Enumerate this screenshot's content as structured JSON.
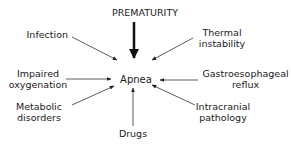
{
  "diagram": {
    "center": "Apnea",
    "top": "PREMATURITY",
    "causes": {
      "infection": "Infection",
      "impaired_oxygenation_1": "Impaired",
      "impaired_oxygenation_2": "oxygenation",
      "metabolic_disorders_1": "Metabolic",
      "metabolic_disorders_2": "disorders",
      "drugs": "Drugs",
      "intracranial_pathology_1": "Intracranial",
      "intracranial_pathology_2": "pathology",
      "gastroesophageal_reflux_1": "Gastroesophageal",
      "gastroesophageal_reflux_2": "reflux",
      "thermal_instability_1": "Thermal",
      "thermal_instability_2": "instability"
    },
    "colors": {
      "text": "#1a1a1a",
      "arrow": "#222222",
      "background": "#ffffff"
    }
  }
}
